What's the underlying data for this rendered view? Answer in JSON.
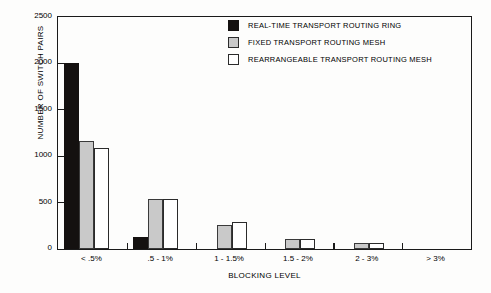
{
  "chart_data": {
    "type": "bar",
    "title": "",
    "xlabel": "BLOCKING LEVEL",
    "ylabel": "NUMBER OF SWITCH PAIRS",
    "categories": [
      "< .5%",
      ".5 - 1%",
      "1 - 1.5%",
      "1.5 - 2%",
      "2 - 3%",
      "> 3%"
    ],
    "series": [
      {
        "name": "REAL-TIME TRANSPORT ROUTING RING",
        "color": "#141110",
        "style": "black",
        "values": [
          2000,
          125,
          0,
          0,
          0,
          0
        ]
      },
      {
        "name": "FIXED TRANSPORT ROUTING MESH",
        "color": "#c9c9c9",
        "style": "gray",
        "values": [
          1165,
          540,
          260,
          110,
          60,
          0
        ]
      },
      {
        "name": "REARRANGEABLE TRANSPORT ROUTING MESH",
        "color": "#ffffff",
        "style": "white",
        "values": [
          1090,
          540,
          290,
          110,
          60,
          0
        ]
      }
    ],
    "ylim": [
      0,
      2500
    ],
    "yticks": [
      0,
      500,
      1000,
      1500,
      2000,
      2500
    ],
    "ytick_labels": [
      "0",
      "500",
      "1000",
      "1500",
      "2000",
      "2500"
    ],
    "grid": false,
    "legend_position": "top-right",
    "frame": "box"
  }
}
